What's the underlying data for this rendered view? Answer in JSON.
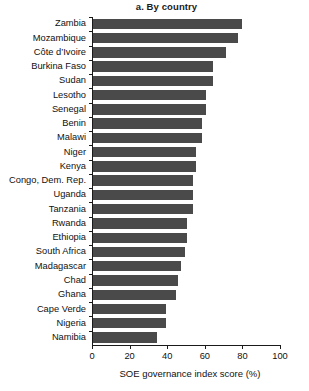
{
  "chart_data": {
    "type": "bar",
    "orientation": "horizontal",
    "title": "a. By country",
    "xlabel": "SOE governance index score (%)",
    "ylabel": "",
    "xlim": [
      0,
      100
    ],
    "xticks": [
      0,
      20,
      40,
      60,
      80,
      100
    ],
    "grid": false,
    "legend": null,
    "bar_color": "#4a4a4a",
    "categories": [
      "Zambia",
      "Mozambique",
      "Côte d’Ivoire",
      "Burkina Faso",
      "Sudan",
      "Lesotho",
      "Senegal",
      "Benin",
      "Malawi",
      "Niger",
      "Kenya",
      "Congo, Dem. Rep.",
      "Uganda",
      "Tanzania",
      "Rwanda",
      "Ethiopia",
      "South Africa",
      "Madagascar",
      "Chad",
      "Ghana",
      "Cape Verde",
      "Nigeria",
      "Namibia"
    ],
    "values": [
      79,
      77,
      71,
      64,
      64,
      60,
      60,
      58,
      58,
      55,
      55,
      53,
      53,
      53,
      50,
      50,
      49,
      47,
      45,
      44,
      39,
      39,
      34
    ]
  }
}
